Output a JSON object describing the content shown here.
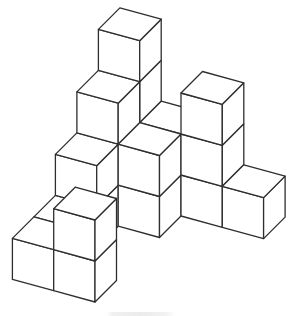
{
  "figure": {
    "line_color": "#2e2e2e",
    "background_color": "#ffffff",
    "projection": {
      "origin": [
        95,
        302
      ],
      "axis_i": [
        -41.3,
        -11.3
      ],
      "axis_j": [
        21.5,
        -21.5
      ],
      "axis_k": [
        0,
        -41
      ]
    },
    "cubes": [
      [
        0,
        0,
        0
      ],
      [
        0,
        0,
        1
      ],
      [
        1,
        0,
        0
      ],
      [
        1,
        1,
        0
      ],
      [
        1,
        2,
        0
      ],
      [
        1,
        2,
        1
      ],
      [
        1,
        3,
        0
      ],
      [
        1,
        3,
        1
      ],
      [
        1,
        3,
        2
      ],
      [
        1,
        4,
        0
      ],
      [
        1,
        4,
        1
      ],
      [
        1,
        4,
        2
      ],
      [
        1,
        4,
        3
      ],
      [
        0,
        3,
        0
      ],
      [
        0,
        3,
        1
      ],
      [
        0,
        4,
        0
      ],
      [
        0,
        4,
        1
      ],
      [
        -1,
        4,
        0
      ],
      [
        -1,
        4,
        1
      ],
      [
        -1,
        4,
        2
      ],
      [
        -2,
        4,
        0
      ]
    ]
  }
}
